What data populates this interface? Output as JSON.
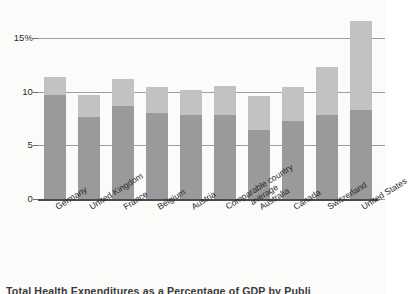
{
  "caption": "Total Health Expenditures as a Percentage of GDP by Publi",
  "colors": {
    "public": "#9a9a9a",
    "private": "#c2c2c2",
    "gridline": "#8c8c8c",
    "axis": "#4a4a4a",
    "text": "#2b2b2b",
    "background": "#fbfbf9"
  },
  "y_axis": {
    "ticks": [
      {
        "label": "15%",
        "value": 15
      },
      {
        "label": "10",
        "value": 10
      },
      {
        "label": "5",
        "value": 5
      },
      {
        "label": "0",
        "value": 0
      }
    ]
  },
  "chart_data": {
    "type": "bar",
    "title": "Total Health Expenditures as a Percentage of GDP by Publi",
    "xlabel": "",
    "ylabel": "",
    "ylim": [
      0,
      17.8
    ],
    "grid": true,
    "legend": "none",
    "stacked": true,
    "categories": [
      "Germany",
      "United Kingdom",
      "France",
      "Belgium",
      "Austria",
      "Comparable country average",
      "Australia",
      "Canada",
      "Switzerland",
      "United States"
    ],
    "series": [
      {
        "name": "Public",
        "values": [
          9.7,
          7.6,
          8.7,
          8.0,
          7.8,
          7.8,
          6.4,
          7.3,
          7.8,
          8.3
        ]
      },
      {
        "name": "Private",
        "values": [
          1.7,
          2.1,
          2.5,
          2.4,
          2.4,
          2.7,
          3.2,
          3.1,
          4.5,
          8.3
        ]
      }
    ],
    "totals": [
      11.4,
      9.7,
      11.2,
      10.4,
      10.2,
      10.5,
      9.6,
      10.4,
      12.3,
      16.6
    ]
  }
}
